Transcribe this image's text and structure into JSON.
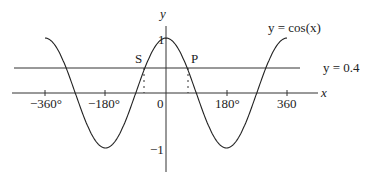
{
  "chart_data": {
    "type": "line",
    "title": "",
    "xlabel": "x",
    "ylabel": "y",
    "xlim": [
      -360,
      360
    ],
    "ylim": [
      -1,
      1
    ],
    "grid": false,
    "series": [
      {
        "name": "y = cos(x)",
        "function": "cos(x)",
        "x": [
          -360,
          -270,
          -180,
          -90,
          0,
          90,
          180,
          270,
          360
        ],
        "values": [
          1,
          0,
          -1,
          0,
          1,
          0,
          -1,
          0,
          1
        ]
      },
      {
        "name": "y = 0.4",
        "function": "0.4",
        "x": [
          -360,
          360
        ],
        "values": [
          0.4,
          0.4
        ]
      }
    ],
    "x_tick_labels": [
      "-360°",
      "-180°",
      "0",
      "180°",
      "360"
    ],
    "y_tick_labels": [
      "1",
      "-1"
    ],
    "annotations": [
      {
        "label": "S",
        "x": -66.4,
        "y": 0.4
      },
      {
        "label": "P",
        "x": 66.4,
        "y": 0.4
      }
    ]
  },
  "labels": {
    "y_axis": "y",
    "x_axis": "x",
    "curve": "y = cos(x)",
    "line": "y = 0.4",
    "tick_neg360": "−360°",
    "tick_neg180": "−180°",
    "tick_0": "0",
    "tick_180": "180°",
    "tick_360": "360",
    "tick_1": "1",
    "tick_neg1": "−1",
    "point_s": "S",
    "point_p": "P"
  }
}
